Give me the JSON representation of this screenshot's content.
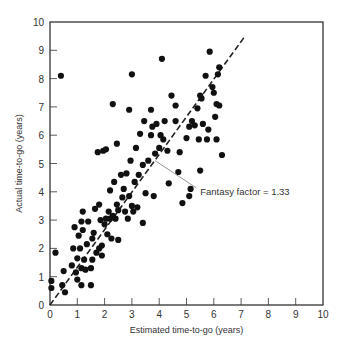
{
  "chart_data": {
    "type": "scatter",
    "title": "",
    "xlabel": "Estimated time-to-go (years)",
    "ylabel": "Actual time-to-go (years)",
    "xlim": [
      0,
      10
    ],
    "ylim": [
      0,
      10
    ],
    "xticks": [
      0,
      1,
      2,
      3,
      4,
      5,
      6,
      7,
      8,
      9,
      10
    ],
    "yticks": [
      0,
      1,
      2,
      3,
      4,
      5,
      6,
      7,
      8,
      9,
      10
    ],
    "grid": false,
    "reference_line": {
      "style": "dashed",
      "slope": 1.33,
      "x_range": [
        0,
        7.1
      ],
      "label": "Fantasy factor = 1.33"
    },
    "annotation": {
      "text": "Fantasy factor = 1.33",
      "x": 5.5,
      "y": 4.0,
      "arrow_to": [
        3.85,
        5.1
      ]
    },
    "points": [
      [
        0.05,
        0.6
      ],
      [
        0.05,
        0.85
      ],
      [
        0.2,
        1.85
      ],
      [
        0.4,
        8.1
      ],
      [
        0.45,
        0.7
      ],
      [
        0.55,
        0.45
      ],
      [
        0.5,
        1.2
      ],
      [
        0.8,
        1.4
      ],
      [
        0.9,
        2.75
      ],
      [
        0.95,
        1.15
      ],
      [
        1.0,
        0.9
      ],
      [
        1.0,
        1.65
      ],
      [
        1.05,
        2.45
      ],
      [
        1.1,
        2.0
      ],
      [
        1.15,
        0.7
      ],
      [
        1.15,
        1.3
      ],
      [
        1.15,
        2.95
      ],
      [
        1.2,
        3.3
      ],
      [
        1.2,
        2.65
      ],
      [
        1.25,
        1.6
      ],
      [
        1.3,
        1.25
      ],
      [
        1.35,
        2.15
      ],
      [
        1.4,
        2.95
      ],
      [
        1.5,
        0.7
      ],
      [
        1.5,
        1.3
      ],
      [
        1.55,
        1.6
      ],
      [
        1.55,
        2.35
      ],
      [
        1.6,
        2.55
      ],
      [
        1.65,
        3.4
      ],
      [
        1.7,
        1.85
      ],
      [
        1.8,
        2.0
      ],
      [
        1.85,
        3.0
      ],
      [
        1.9,
        2.1
      ],
      [
        1.9,
        1.75
      ],
      [
        2.0,
        2.85
      ],
      [
        2.05,
        3.05
      ],
      [
        2.1,
        2.5
      ],
      [
        2.15,
        3.3
      ],
      [
        2.2,
        3.05
      ],
      [
        2.2,
        4.05
      ],
      [
        2.25,
        2.35
      ],
      [
        2.3,
        3.15
      ],
      [
        2.35,
        4.35
      ],
      [
        2.4,
        3.05
      ],
      [
        2.45,
        3.55
      ],
      [
        2.5,
        2.3
      ],
      [
        2.5,
        3.35
      ],
      [
        2.6,
        4.6
      ],
      [
        2.65,
        3.8
      ],
      [
        2.7,
        4.1
      ],
      [
        2.75,
        3.3
      ],
      [
        2.8,
        4.65
      ],
      [
        2.85,
        3.05
      ],
      [
        2.9,
        3.85
      ],
      [
        2.95,
        5.1
      ],
      [
        3.0,
        3.5
      ],
      [
        3.05,
        3.3
      ],
      [
        3.1,
        4.35
      ],
      [
        3.15,
        5.55
      ],
      [
        3.2,
        3.45
      ],
      [
        3.25,
        4.6
      ],
      [
        3.3,
        6.05
      ],
      [
        3.4,
        2.9
      ],
      [
        3.4,
        4.95
      ],
      [
        3.45,
        6.5
      ],
      [
        3.5,
        3.95
      ],
      [
        3.6,
        5.1
      ],
      [
        3.7,
        6.0
      ],
      [
        3.75,
        6.3
      ],
      [
        3.8,
        3.85
      ],
      [
        3.85,
        5.35
      ],
      [
        3.9,
        6.4
      ],
      [
        4.0,
        5.55
      ],
      [
        4.05,
        6.0
      ],
      [
        4.1,
        8.7
      ],
      [
        4.15,
        5.85
      ],
      [
        4.2,
        6.5
      ],
      [
        4.3,
        5.45
      ],
      [
        4.35,
        4.3
      ],
      [
        4.45,
        7.4
      ],
      [
        4.6,
        6.5
      ],
      [
        4.7,
        4.7
      ],
      [
        4.75,
        5.4
      ],
      [
        4.85,
        3.6
      ],
      [
        5.0,
        5.9
      ],
      [
        5.1,
        6.3
      ],
      [
        5.15,
        4.1
      ],
      [
        5.2,
        6.5
      ],
      [
        5.3,
        6.35
      ],
      [
        5.4,
        6.95
      ],
      [
        5.45,
        5.85
      ],
      [
        5.5,
        7.4
      ],
      [
        5.55,
        7.3
      ],
      [
        5.6,
        6.4
      ],
      [
        5.7,
        8.1
      ],
      [
        5.75,
        5.85
      ],
      [
        5.8,
        6.2
      ],
      [
        5.85,
        8.95
      ],
      [
        5.95,
        7.7
      ],
      [
        6.0,
        7.5
      ],
      [
        6.05,
        6.65
      ],
      [
        6.1,
        7.1
      ],
      [
        6.15,
        8.15
      ],
      [
        6.2,
        8.4
      ],
      [
        6.2,
        7.05
      ],
      [
        6.3,
        5.3
      ],
      [
        2.3,
        7.1
      ],
      [
        3.0,
        8.15
      ],
      [
        1.95,
        5.45
      ],
      [
        2.05,
        5.5
      ],
      [
        4.6,
        7.05
      ],
      [
        6.1,
        5.85
      ],
      [
        5.1,
        3.85
      ],
      [
        3.7,
        6.9
      ],
      [
        2.9,
        6.9
      ],
      [
        1.75,
        5.4
      ],
      [
        2.45,
        5.7
      ],
      [
        5.5,
        4.75
      ],
      [
        0.85,
        2.0
      ],
      [
        1.8,
        3.55
      ]
    ]
  },
  "axes": {
    "x_title": "Estimated time-to-go (years)",
    "y_title": "Actual time-to-go (years)",
    "x_ticks": [
      "0",
      "1",
      "2",
      "3",
      "4",
      "5",
      "6",
      "7",
      "8",
      "9",
      "10"
    ],
    "y_ticks": [
      "0",
      "1",
      "2",
      "3",
      "4",
      "5",
      "6",
      "7",
      "8",
      "9",
      "10"
    ]
  },
  "annotation": {
    "label": "Fantasy factor = 1.33"
  },
  "colors": {
    "points": "#111111",
    "axes": "#333333",
    "line": "#222222",
    "arrow": "#888888"
  }
}
